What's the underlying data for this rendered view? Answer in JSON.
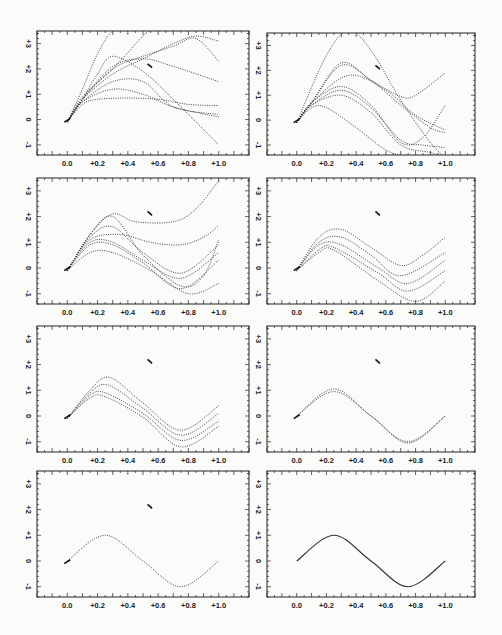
{
  "figure": {
    "x_tick_labels": [
      "0.0",
      "+0.2",
      "+0.4",
      "+0.6",
      "+0.8",
      "+1.0"
    ],
    "y_tick_labels": [
      "-1",
      "0",
      "+1",
      "+2",
      "+3"
    ]
  },
  "chart_data": [
    {
      "type": "line",
      "panel": 1,
      "title": "",
      "xlim": [
        -0.2,
        1.2
      ],
      "ylim": [
        -1.4,
        3.5
      ],
      "style": "dotted",
      "series": [
        {
          "name": "c1",
          "x": [
            0,
            0.1,
            0.2,
            0.3,
            0.4
          ],
          "y": [
            -0.1,
            1.2,
            2.6,
            3.5,
            3.5
          ]
        },
        {
          "name": "c2",
          "x": [
            0,
            0.1,
            0.3,
            0.5,
            0.55
          ],
          "y": [
            -0.1,
            0.9,
            2.0,
            3.3,
            3.5
          ]
        },
        {
          "name": "c3",
          "x": [
            0,
            0.1,
            0.3,
            0.5,
            0.7,
            0.85,
            1.0
          ],
          "y": [
            -0.1,
            0.8,
            1.8,
            2.4,
            3.0,
            3.3,
            3.1
          ]
        },
        {
          "name": "c4",
          "x": [
            0,
            0.1,
            0.3,
            0.5,
            0.7,
            0.85,
            1.0
          ],
          "y": [
            -0.1,
            0.8,
            2.0,
            2.5,
            2.9,
            3.2,
            2.3
          ]
        },
        {
          "name": "c5",
          "x": [
            0,
            0.1,
            0.3,
            0.5,
            0.7,
            1.0
          ],
          "y": [
            -0.1,
            0.8,
            2.1,
            2.4,
            2.1,
            1.5
          ]
        },
        {
          "name": "c6",
          "x": [
            0,
            0.1,
            0.2,
            0.3,
            0.5,
            0.7,
            1.0
          ],
          "y": [
            -0.1,
            0.8,
            1.8,
            2.5,
            1.9,
            0.8,
            -1.0
          ]
        },
        {
          "name": "c7",
          "x": [
            0,
            0.1,
            0.3,
            0.5,
            0.7,
            1.0
          ],
          "y": [
            -0.1,
            0.7,
            1.5,
            1.5,
            0.5,
            0.2
          ]
        },
        {
          "name": "c8",
          "x": [
            0,
            0.1,
            0.3,
            0.5,
            0.7,
            1.0
          ],
          "y": [
            -0.1,
            0.7,
            1.2,
            1.0,
            0.5,
            0.1
          ]
        },
        {
          "name": "c9",
          "x": [
            0,
            0.1,
            0.2,
            0.4,
            0.6,
            0.8,
            1.0
          ],
          "y": [
            -0.1,
            0.6,
            0.8,
            0.85,
            0.8,
            0.6,
            0.55
          ]
        }
      ]
    },
    {
      "type": "line",
      "panel": 2,
      "xlim": [
        -0.2,
        1.2
      ],
      "ylim": [
        -1.4,
        3.5
      ],
      "style": "dotted",
      "series": [
        {
          "name": "c1",
          "x": [
            0,
            0.2,
            0.35,
            0.5,
            0.7,
            0.9,
            1.0
          ],
          "y": [
            -0.1,
            2.6,
            3.6,
            2.8,
            0.8,
            -0.9,
            -1.5
          ]
        },
        {
          "name": "c2",
          "x": [
            0,
            0.1,
            0.3,
            0.5,
            0.7,
            0.8,
            1.0
          ],
          "y": [
            -0.1,
            0.7,
            2.3,
            1.6,
            0.95,
            1.0,
            1.9
          ]
        },
        {
          "name": "c3",
          "x": [
            0,
            0.1,
            0.3,
            0.5,
            0.7,
            0.9,
            1.0
          ],
          "y": [
            -0.1,
            0.7,
            2.2,
            1.6,
            0.6,
            -0.3,
            -0.5
          ]
        },
        {
          "name": "c4",
          "x": [
            0,
            0.1,
            0.35,
            0.6,
            0.8,
            1.0
          ],
          "y": [
            -0.1,
            0.7,
            1.8,
            1.2,
            0.2,
            -0.4
          ]
        },
        {
          "name": "c5",
          "x": [
            0,
            0.1,
            0.3,
            0.5,
            0.7,
            0.85,
            1.0
          ],
          "y": [
            -0.1,
            0.7,
            1.35,
            0.6,
            -0.9,
            -0.7,
            0.6
          ]
        },
        {
          "name": "c6",
          "x": [
            0,
            0.1,
            0.3,
            0.5,
            0.7,
            0.85,
            1.0
          ],
          "y": [
            -0.1,
            0.6,
            1.2,
            0.5,
            -0.8,
            -1.0,
            -1.1
          ]
        },
        {
          "name": "c7",
          "x": [
            0,
            0.1,
            0.3,
            0.5,
            0.7,
            0.9,
            1.0
          ],
          "y": [
            -0.1,
            0.6,
            1.0,
            0.3,
            -1.0,
            -1.3,
            -1.5
          ]
        },
        {
          "name": "c8",
          "x": [
            0,
            0.1,
            0.2,
            0.4,
            0.6,
            0.75
          ],
          "y": [
            -0.1,
            0.5,
            0.5,
            -0.3,
            -1.2,
            -1.5
          ]
        }
      ]
    },
    {
      "type": "line",
      "panel": 3,
      "xlim": [
        -0.2,
        1.2
      ],
      "ylim": [
        -1.4,
        3.5
      ],
      "style": "dotted",
      "series": [
        {
          "name": "c1",
          "x": [
            0,
            0.15,
            0.3,
            0.45,
            0.7,
            0.85,
            1.0
          ],
          "y": [
            -0.1,
            1.3,
            2.1,
            1.8,
            1.8,
            2.3,
            3.4
          ]
        },
        {
          "name": "c2",
          "x": [
            0,
            0.15,
            0.35,
            0.55,
            0.75,
            0.9,
            1.0
          ],
          "y": [
            -0.1,
            1.1,
            1.3,
            1.0,
            0.9,
            1.2,
            1.65
          ]
        },
        {
          "name": "c3",
          "x": [
            0,
            0.15,
            0.3,
            0.5,
            0.75,
            0.9,
            1.0
          ],
          "y": [
            -0.1,
            1.3,
            2.0,
            0.5,
            -0.7,
            -0.3,
            1.1
          ]
        },
        {
          "name": "c4",
          "x": [
            0,
            0.15,
            0.3,
            0.5,
            0.75,
            1.0
          ],
          "y": [
            -0.1,
            1.2,
            1.6,
            0.6,
            -0.2,
            0.9
          ]
        },
        {
          "name": "c5",
          "x": [
            0,
            0.15,
            0.3,
            0.5,
            0.75,
            1.0
          ],
          "y": [
            -0.1,
            1.0,
            1.0,
            0.3,
            -0.4,
            0.6
          ]
        },
        {
          "name": "c6",
          "x": [
            0,
            0.15,
            0.3,
            0.5,
            0.75,
            1.0
          ],
          "y": [
            -0.1,
            0.9,
            0.9,
            0.2,
            -0.8,
            0.3
          ]
        },
        {
          "name": "c7",
          "x": [
            0,
            0.15,
            0.3,
            0.55,
            0.8,
            1.0
          ],
          "y": [
            -0.1,
            0.6,
            0.6,
            -0.1,
            -1.0,
            -0.6
          ]
        }
      ]
    },
    {
      "type": "line",
      "panel": 4,
      "xlim": [
        -0.2,
        1.2
      ],
      "ylim": [
        -1.4,
        3.5
      ],
      "style": "dotted",
      "series": [
        {
          "name": "c1",
          "x": [
            0,
            0.15,
            0.3,
            0.5,
            0.7,
            0.85,
            1.0
          ],
          "y": [
            -0.1,
            1.2,
            1.5,
            0.8,
            0.1,
            0.5,
            1.2
          ]
        },
        {
          "name": "c2",
          "x": [
            0,
            0.15,
            0.3,
            0.5,
            0.7,
            1.0
          ],
          "y": [
            -0.1,
            1.0,
            1.2,
            0.5,
            -0.3,
            0.6
          ]
        },
        {
          "name": "c3",
          "x": [
            0,
            0.15,
            0.3,
            0.55,
            0.75,
            1.0
          ],
          "y": [
            -0.1,
            0.9,
            0.9,
            0.0,
            -0.6,
            0.3
          ]
        },
        {
          "name": "c4",
          "x": [
            0,
            0.15,
            0.25,
            0.55,
            0.75,
            1.0
          ],
          "y": [
            -0.1,
            0.7,
            0.8,
            -0.2,
            -0.9,
            -0.1
          ]
        },
        {
          "name": "c5",
          "x": [
            0,
            0.15,
            0.25,
            0.55,
            0.8,
            1.0
          ],
          "y": [
            -0.1,
            0.6,
            0.7,
            -0.5,
            -1.3,
            -0.5
          ]
        }
      ]
    },
    {
      "type": "line",
      "panel": 5,
      "xlim": [
        -0.2,
        1.2
      ],
      "ylim": [
        -1.4,
        3.5
      ],
      "style": "dotted",
      "series": [
        {
          "name": "c1",
          "x": [
            0,
            0.15,
            0.28,
            0.5,
            0.75,
            1.0
          ],
          "y": [
            -0.1,
            1.0,
            1.5,
            0.5,
            -0.55,
            0.4
          ]
        },
        {
          "name": "c2",
          "x": [
            0,
            0.15,
            0.27,
            0.5,
            0.75,
            1.0
          ],
          "y": [
            -0.1,
            0.9,
            1.2,
            0.3,
            -0.75,
            0.1
          ]
        },
        {
          "name": "c3",
          "x": [
            0,
            0.15,
            0.25,
            0.5,
            0.75,
            1.0
          ],
          "y": [
            -0.1,
            0.8,
            0.9,
            0.1,
            -0.95,
            -0.2
          ]
        },
        {
          "name": "c4",
          "x": [
            0,
            0.15,
            0.25,
            0.5,
            0.75,
            1.0
          ],
          "y": [
            -0.1,
            0.7,
            0.75,
            -0.05,
            -1.2,
            -0.4
          ]
        }
      ]
    },
    {
      "type": "line",
      "panel": 6,
      "xlim": [
        -0.2,
        1.2
      ],
      "ylim": [
        -1.4,
        3.5
      ],
      "style": "dotted",
      "series": [
        {
          "name": "c1",
          "x": [
            0,
            0.25,
            0.5,
            0.75,
            1.0
          ],
          "y": [
            0,
            1.05,
            0,
            -1.0,
            0
          ]
        },
        {
          "name": "c2",
          "x": [
            0,
            0.25,
            0.5,
            0.75,
            1.0
          ],
          "y": [
            0,
            0.95,
            0,
            -1.05,
            0
          ]
        }
      ]
    },
    {
      "type": "line",
      "panel": 7,
      "xlim": [
        -0.2,
        1.2
      ],
      "ylim": [
        -1.4,
        3.5
      ],
      "style": "dotted",
      "series": [
        {
          "name": "c1",
          "x": [
            0,
            0.25,
            0.5,
            0.75,
            1.0
          ],
          "y": [
            0,
            1.0,
            0,
            -1.0,
            0
          ]
        }
      ]
    },
    {
      "type": "line",
      "panel": 8,
      "xlim": [
        -0.2,
        1.2
      ],
      "ylim": [
        -1.4,
        3.5
      ],
      "style": "solid",
      "series": [
        {
          "name": "sin(2πx)",
          "x": [
            0,
            0.25,
            0.5,
            0.75,
            1.0
          ],
          "y": [
            0,
            1.0,
            0,
            -1.0,
            0
          ]
        }
      ]
    }
  ]
}
